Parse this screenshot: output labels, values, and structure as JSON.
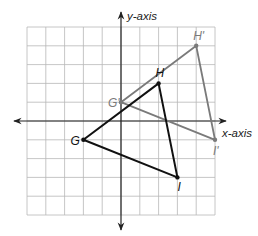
{
  "diagram": {
    "type": "coordinate-plane-translation",
    "x_axis_label": "x-axis",
    "y_axis_label": "y-axis",
    "x_range": [
      -5,
      5
    ],
    "y_range": [
      -5,
      5
    ],
    "grid": true,
    "colors": {
      "original": "#111111",
      "image": "#7a7a7a",
      "grid": "#b8b8b8",
      "axis": "#222222"
    },
    "triangles": [
      {
        "name": "original",
        "vertices": [
          {
            "label": "G",
            "x": -2,
            "y": -1
          },
          {
            "label": "H",
            "x": 2,
            "y": 2
          },
          {
            "label": "I",
            "x": 3,
            "y": -3
          }
        ]
      },
      {
        "name": "image",
        "vertices": [
          {
            "label": "G'",
            "x": 0,
            "y": 1
          },
          {
            "label": "H'",
            "x": 4,
            "y": 4
          },
          {
            "label": "I'",
            "x": 5,
            "y": -1
          }
        ]
      }
    ]
  }
}
